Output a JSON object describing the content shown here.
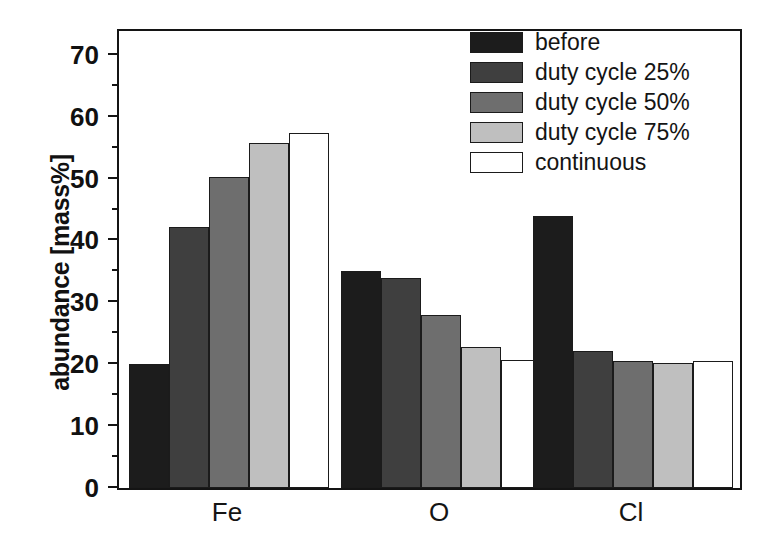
{
  "chart_data": {
    "type": "bar",
    "title": "",
    "xlabel": "",
    "ylabel": "abundance [mass%]",
    "categories": [
      "Fe",
      "O",
      "Cl"
    ],
    "ylim": [
      0,
      74.5
    ],
    "yticks": [
      0,
      10,
      20,
      30,
      40,
      50,
      60,
      70
    ],
    "ytick_labels": [
      "0",
      "10",
      "20",
      "30",
      "40",
      "50",
      "60",
      "70"
    ],
    "yminor_ticks": [
      5,
      15,
      25,
      35,
      45,
      55,
      65
    ],
    "grid": false,
    "legend_position": "top-right",
    "series": [
      {
        "name": "before",
        "color": "#1c1c1c",
        "values": [
          20.0,
          35.0,
          44.0
        ]
      },
      {
        "name": "duty cycle 25%",
        "color": "#3f3f3f",
        "values": [
          42.2,
          34.0,
          22.2
        ]
      },
      {
        "name": "duty cycle 50%",
        "color": "#6e6e6e",
        "values": [
          50.2,
          28.0,
          20.5
        ]
      },
      {
        "name": "duty cycle 75%",
        "color": "#bfbfbf",
        "values": [
          55.8,
          22.8,
          20.2
        ]
      },
      {
        "name": "continuous",
        "color": "#ffffff",
        "values": [
          57.3,
          20.7,
          20.5
        ]
      }
    ]
  },
  "axes": {
    "y_title": "abundance [mass%]"
  },
  "legend": {
    "entries": [
      {
        "label": "before"
      },
      {
        "label": "duty cycle 25%"
      },
      {
        "label": "duty cycle 50%"
      },
      {
        "label": "duty cycle 75%"
      },
      {
        "label": "continuous"
      }
    ]
  }
}
